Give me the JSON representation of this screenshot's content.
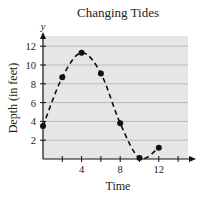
{
  "chart_data": {
    "type": "line",
    "title": "Changing Tides",
    "xlabel": "Time",
    "ylabel": "Depth (in feet)",
    "y_axis_letter": "y",
    "x": [
      0,
      2,
      4,
      6,
      8,
      10,
      12
    ],
    "series": [
      {
        "name": "Depth",
        "values": [
          3.5,
          8.7,
          11.3,
          9.1,
          3.8,
          0.1,
          1.2
        ],
        "style": "dashed",
        "markers": true
      }
    ],
    "xticks": [
      4,
      8,
      12
    ],
    "xtick_marks": [
      2,
      4,
      6,
      8,
      10,
      12,
      14
    ],
    "yticks": [
      2,
      4,
      6,
      8,
      10,
      12
    ],
    "xlim": [
      0,
      15
    ],
    "ylim": [
      0,
      13
    ],
    "grid": "horizontal",
    "legend": "none"
  },
  "colors": {
    "plot_background": "#e6e6e6",
    "gridline": "#b0b0b0",
    "line": "#111111",
    "text": "#222222"
  }
}
